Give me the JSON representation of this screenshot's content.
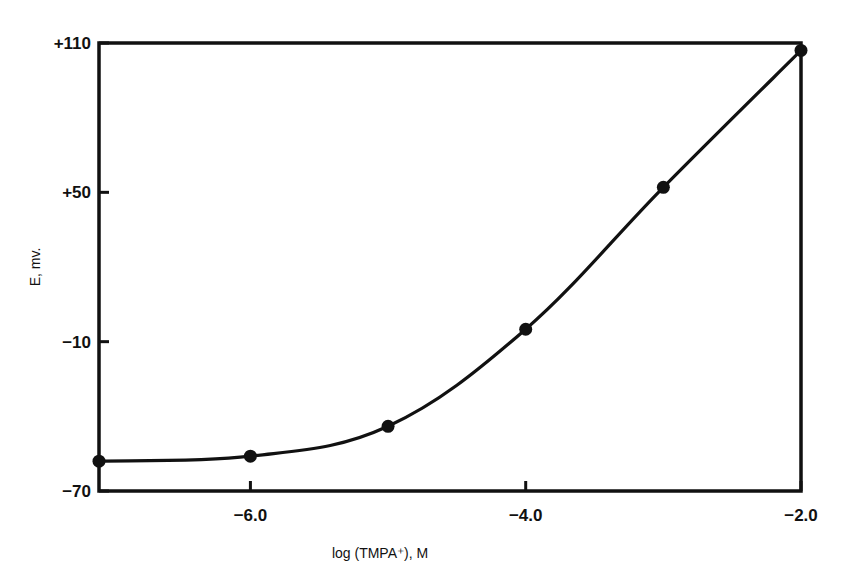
{
  "chart_data": {
    "type": "line",
    "title": "",
    "xlabel": "log (TMPA⁺), M",
    "ylabel": "E, mv.",
    "xlim": [
      -7.1,
      -2.0
    ],
    "ylim": [
      -70,
      110
    ],
    "grid": false,
    "legend": null,
    "x_ticks": [
      {
        "value": -6.0,
        "label": "-6.0"
      },
      {
        "value": -4.0,
        "label": "-4.0"
      },
      {
        "value": -2.0,
        "label": "-2.0"
      }
    ],
    "y_ticks": [
      {
        "value": 110,
        "label": "+110"
      },
      {
        "value": 50,
        "label": "+50"
      },
      {
        "value": -10,
        "label": "-10"
      },
      {
        "value": -70,
        "label": "-70"
      }
    ],
    "series": [
      {
        "name": "E vs log(TMPA+)",
        "marker": "filled-circle",
        "color": "#111111",
        "x": [
          -7.1,
          -6.0,
          -5.0,
          -4.0,
          -3.0,
          -2.0
        ],
        "values": [
          -58,
          -56,
          -44,
          -5,
          52,
          107
        ]
      }
    ]
  }
}
